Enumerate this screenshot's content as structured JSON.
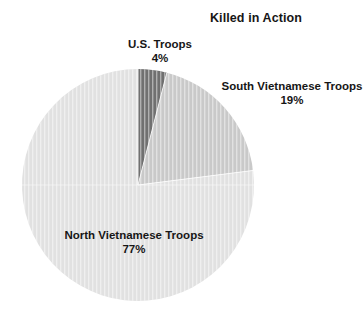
{
  "chart": {
    "title": "Killed in Action"
  },
  "labels": {
    "us": {
      "name": "U.S. Troops",
      "percent": "4%"
    },
    "south": {
      "name": "South Vietnamese Troops",
      "percent": "19%"
    },
    "north": {
      "name": "North Vietnamese Troops",
      "percent": "77%"
    }
  },
  "chart_data": {
    "type": "pie",
    "title": "Killed in Action",
    "categories": [
      "U.S. Troops",
      "South Vietnamese Troops",
      "North Vietnamese Troops"
    ],
    "values": [
      4,
      19,
      77
    ],
    "value_labels": [
      "4%",
      "19%",
      "77%"
    ],
    "unit": "percent",
    "total": 100,
    "start_angle_deg": 0,
    "direction": "clockwise",
    "colors": [
      "#707070",
      "#c9c9c9",
      "#e1e1e1"
    ],
    "slice_border_color": "#ffffff",
    "legend": "none",
    "labels_position": "outside-callout",
    "grid": false,
    "background": "#ffffff"
  },
  "geometry": {
    "center_x": 138,
    "center_y": 185,
    "radius": 116
  }
}
